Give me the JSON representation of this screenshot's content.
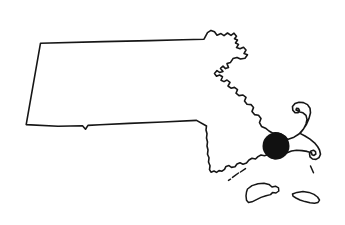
{
  "figure": {
    "type": "map-outline",
    "caption": "",
    "background_color": "#ffffff",
    "outline_color": "#161616",
    "outline_width_px": 1.6,
    "canvas": {
      "width": 345,
      "height": 225
    }
  },
  "map": {
    "name": "massachusetts-outline-map",
    "fill_color": "#ffffff",
    "stroke_color": "#161616",
    "bounds": {
      "x_min": 25,
      "y_min": 30,
      "x_max": 323,
      "y_max": 207
    }
  },
  "marker": {
    "name": "location-dot",
    "shape": "filled-circle",
    "color": "#111111",
    "center_x": 276,
    "center_y": 146,
    "radius": 13.5,
    "label": ""
  },
  "landmasses": [
    {
      "name": "mainland",
      "label": ""
    },
    {
      "name": "marthas-vineyard",
      "label": ""
    },
    {
      "name": "nantucket",
      "label": ""
    },
    {
      "name": "elizabeth-islands",
      "label": ""
    }
  ]
}
